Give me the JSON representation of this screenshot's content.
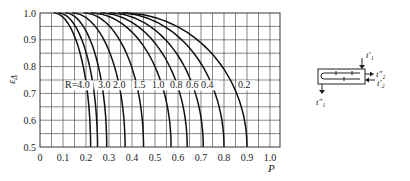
{
  "chart_data": {
    "type": "line",
    "title": "",
    "xlabel": "P",
    "ylabel": "ε_Δ",
    "xlim": [
      0,
      1.0
    ],
    "ylim": [
      0.5,
      1.0
    ],
    "grid": true,
    "x_ticks": [
      "0",
      "0.1",
      "0.2",
      "0.3",
      "0.4",
      "0.5",
      "0.6",
      "0.7",
      "0.8",
      "0.9",
      "1.0"
    ],
    "y_ticks": [
      "0.5",
      "0.6",
      "0.7",
      "0.8",
      "0.9",
      "1.0"
    ],
    "label_prefix": "R=",
    "series": [
      {
        "name": "4.0",
        "label": "R=4.0",
        "p_top": 0.06,
        "p_bottom": 0.22
      },
      {
        "name": "3.0",
        "label": "3.0",
        "p_top": 0.08,
        "p_bottom": 0.25
      },
      {
        "name": "2.0",
        "label": "2.0",
        "p_top": 0.11,
        "p_bottom": 0.29
      },
      {
        "name": "1.5",
        "label": "1.5",
        "p_top": 0.14,
        "p_bottom": 0.37
      },
      {
        "name": "1.0",
        "label": "1.0",
        "p_top": 0.19,
        "p_bottom": 0.45
      },
      {
        "name": "0.8",
        "label": "0.8",
        "p_top": 0.22,
        "p_bottom": 0.57
      },
      {
        "name": "0.6",
        "label": "0.6",
        "p_top": 0.26,
        "p_bottom": 0.64
      },
      {
        "name": "0.4",
        "label": "0.4",
        "p_top": 0.3,
        "p_bottom": 0.71
      },
      {
        "name": "0.3",
        "label": "",
        "p_top": 0.34,
        "p_bottom": 0.8
      },
      {
        "name": "0.2",
        "label": "0.2",
        "p_top": 0.36,
        "p_bottom": 0.9
      }
    ],
    "label_y": 0.73
  },
  "diagram": {
    "labels": {
      "t1_in": "t′₁",
      "t1_out": "t″₁",
      "t2_out": "t″₂",
      "t2_in": "t′₂"
    }
  }
}
